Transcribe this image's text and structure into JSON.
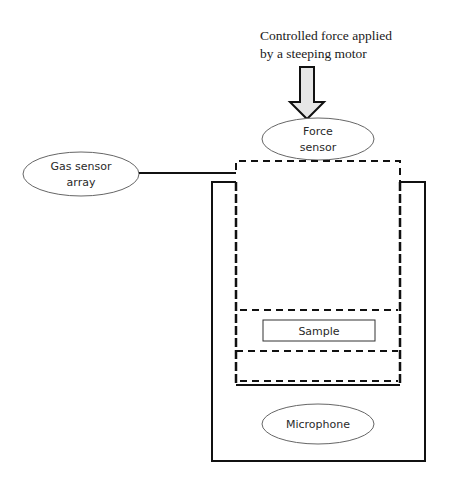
{
  "diagram": {
    "force_caption": {
      "line1": "Controlled force applied",
      "line2": "by a steeping motor"
    },
    "labels": {
      "force_sensor_line1": "Force",
      "force_sensor_line2": "sensor",
      "gas_sensor_line1": "Gas sensor",
      "gas_sensor_line2": "array",
      "sample": "Sample",
      "microphone": "Microphone"
    },
    "colors": {
      "stroke": "#111111",
      "ellipse_stroke": "#555555",
      "arrow_fill": "#e6e6e6",
      "background": "#ffffff"
    }
  }
}
